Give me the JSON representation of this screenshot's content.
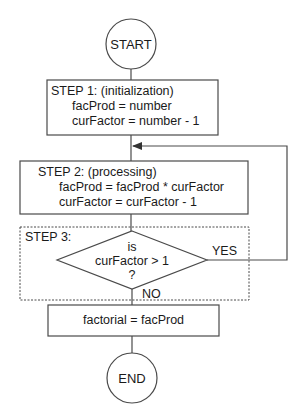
{
  "flowchart": {
    "start": {
      "label": "START"
    },
    "step1": {
      "title": "STEP 1: (initialization)",
      "lines": [
        "facProd = number",
        "curFactor = number - 1"
      ]
    },
    "step2": {
      "title": "STEP 2: (processing)",
      "lines": [
        "facProd = facProd * curFactor",
        "curFactor = curFactor - 1"
      ]
    },
    "step3": {
      "title": "STEP 3:",
      "decision": [
        "is",
        "curFactor > 1",
        "?"
      ],
      "yes_label": "YES",
      "no_label": "NO"
    },
    "result": {
      "label": "factorial = facProd"
    },
    "end": {
      "label": "END"
    }
  }
}
